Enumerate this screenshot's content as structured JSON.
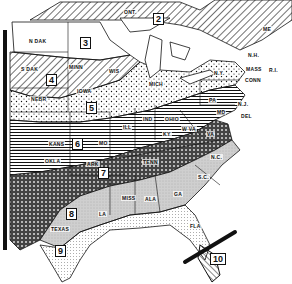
{
  "map": {
    "title": "Plant hardiness zones, eastern United States",
    "zones": [
      {
        "id": "2",
        "label": "2",
        "x": 153,
        "y": 13
      },
      {
        "id": "3",
        "label": "3",
        "x": 80,
        "y": 37
      },
      {
        "id": "4",
        "label": "4",
        "x": 46,
        "y": 74
      },
      {
        "id": "5",
        "label": "5",
        "x": 86,
        "y": 102
      },
      {
        "id": "6",
        "label": "6",
        "x": 72,
        "y": 138
      },
      {
        "id": "7",
        "label": "7",
        "x": 98,
        "y": 167
      },
      {
        "id": "8",
        "label": "8",
        "x": 66,
        "y": 208
      },
      {
        "id": "9",
        "label": "9",
        "x": 55,
        "y": 245
      },
      {
        "id": "10",
        "label": "10",
        "x": 210,
        "y": 253
      }
    ],
    "states": [
      {
        "name": "N DAK",
        "x": 28,
        "y": 38
      },
      {
        "name": "S DAK",
        "x": 20,
        "y": 66
      },
      {
        "name": "NEBR",
        "x": 30,
        "y": 96
      },
      {
        "name": "KANS",
        "x": 48,
        "y": 141
      },
      {
        "name": "OKLA",
        "x": 44,
        "y": 158
      },
      {
        "name": "TEXAS",
        "x": 50,
        "y": 226
      },
      {
        "name": "MINN",
        "x": 68,
        "y": 64
      },
      {
        "name": "IOWA",
        "x": 76,
        "y": 88
      },
      {
        "name": "WIS",
        "x": 108,
        "y": 68
      },
      {
        "name": "MO",
        "x": 98,
        "y": 140
      },
      {
        "name": "ARK",
        "x": 86,
        "y": 161
      },
      {
        "name": "LA",
        "x": 98,
        "y": 211
      },
      {
        "name": "ILL",
        "x": 122,
        "y": 124
      },
      {
        "name": "IND",
        "x": 142,
        "y": 116
      },
      {
        "name": "OHIO",
        "x": 164,
        "y": 116
      },
      {
        "name": "KY",
        "x": 162,
        "y": 131
      },
      {
        "name": "TENN",
        "x": 142,
        "y": 159
      },
      {
        "name": "MISS",
        "x": 121,
        "y": 195
      },
      {
        "name": "ALA",
        "x": 144,
        "y": 196
      },
      {
        "name": "GA",
        "x": 173,
        "y": 191
      },
      {
        "name": "FLA",
        "x": 189,
        "y": 223
      },
      {
        "name": "S.C.",
        "x": 197,
        "y": 174
      },
      {
        "name": "N.C.",
        "x": 210,
        "y": 154
      },
      {
        "name": "VA",
        "x": 206,
        "y": 131
      },
      {
        "name": "W VA",
        "x": 181,
        "y": 126
      },
      {
        "name": "PA",
        "x": 208,
        "y": 97
      },
      {
        "name": "N.Y.",
        "x": 213,
        "y": 70
      },
      {
        "name": "N.J.",
        "x": 237,
        "y": 101
      },
      {
        "name": "DEL",
        "x": 240,
        "y": 113
      },
      {
        "name": "MD",
        "x": 216,
        "y": 109
      },
      {
        "name": "CONN",
        "x": 244,
        "y": 77
      },
      {
        "name": "MASS",
        "x": 245,
        "y": 66
      },
      {
        "name": "R.I.",
        "x": 268,
        "y": 67
      },
      {
        "name": "N.H.",
        "x": 247,
        "y": 52
      },
      {
        "name": "ME",
        "x": 262,
        "y": 26
      },
      {
        "name": "MICH",
        "x": 148,
        "y": 81
      },
      {
        "name": "ONT.",
        "x": 123,
        "y": 9
      }
    ]
  }
}
